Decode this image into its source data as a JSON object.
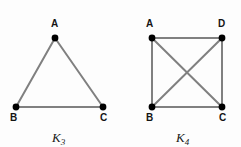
{
  "figure": {
    "background_color": "#fdfdfd",
    "edge_color": "#808080",
    "vertex_color": "#000000",
    "label_color": "#141414"
  },
  "graphs": [
    {
      "name": "K3",
      "caption_base": "K",
      "caption_sub": "3",
      "caption_x": 52,
      "caption_y": 131,
      "vertices": [
        {
          "id": "A",
          "label": "A",
          "cx": 55,
          "cy": 38,
          "label_x": 51,
          "label_y": 19
        },
        {
          "id": "B",
          "label": "B",
          "cx": 16,
          "cy": 107,
          "label_x": 10,
          "label_y": 113
        },
        {
          "id": "C",
          "label": "C",
          "cx": 103,
          "cy": 107,
          "label_x": 100,
          "label_y": 113
        }
      ],
      "edges": [
        {
          "from": "A",
          "to": "B"
        },
        {
          "from": "A",
          "to": "C"
        },
        {
          "from": "B",
          "to": "C"
        }
      ]
    },
    {
      "name": "K4",
      "caption_base": "K",
      "caption_sub": "4",
      "caption_x": 176,
      "caption_y": 131,
      "vertices": [
        {
          "id": "A",
          "label": "A",
          "cx": 32,
          "cy": 38,
          "label_x": 26,
          "label_y": 19
        },
        {
          "id": "D",
          "label": "D",
          "cx": 102,
          "cy": 38,
          "label_x": 98,
          "label_y": 19
        },
        {
          "id": "B",
          "label": "B",
          "cx": 32,
          "cy": 107,
          "label_x": 26,
          "label_y": 113
        },
        {
          "id": "C",
          "label": "C",
          "cx": 102,
          "cy": 107,
          "label_x": 99,
          "label_y": 113
        }
      ],
      "edges": [
        {
          "from": "A",
          "to": "D"
        },
        {
          "from": "A",
          "to": "B"
        },
        {
          "from": "D",
          "to": "C"
        },
        {
          "from": "B",
          "to": "C"
        },
        {
          "from": "A",
          "to": "C"
        },
        {
          "from": "D",
          "to": "B"
        }
      ]
    }
  ]
}
